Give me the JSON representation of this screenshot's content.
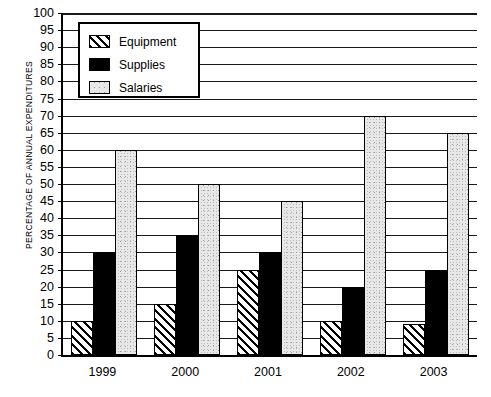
{
  "chart_data": {
    "type": "bar",
    "title": "",
    "xlabel": "",
    "ylabel": "PERCENTAGE OF ANNUAL EXPENDITURES",
    "categories": [
      "1999",
      "2000",
      "2001",
      "2002",
      "2003"
    ],
    "series": [
      {
        "name": "Equipment",
        "values": [
          10,
          15,
          25,
          10,
          9
        ]
      },
      {
        "name": "Supplies",
        "values": [
          30,
          35,
          30,
          20,
          25
        ]
      },
      {
        "name": "Salaries",
        "values": [
          60,
          50,
          45,
          70,
          65
        ]
      }
    ],
    "ylim": [
      0,
      100
    ],
    "ytick_step": 5,
    "yticks": [
      0,
      5,
      10,
      15,
      20,
      25,
      30,
      35,
      40,
      45,
      50,
      55,
      60,
      65,
      70,
      75,
      80,
      85,
      90,
      95,
      100
    ],
    "grid": true,
    "legend_position": "top-left",
    "colors": {
      "equipment": "#ffffff",
      "supplies": "#000000",
      "salaries": "#e8e8e8",
      "axis": "#000000",
      "grid": "#1a1a1a"
    }
  },
  "legend": {
    "items": [
      {
        "label": "Equipment",
        "key": "equipment"
      },
      {
        "label": "Supplies",
        "key": "supplies"
      },
      {
        "label": "Salaries",
        "key": "salaries"
      }
    ]
  }
}
